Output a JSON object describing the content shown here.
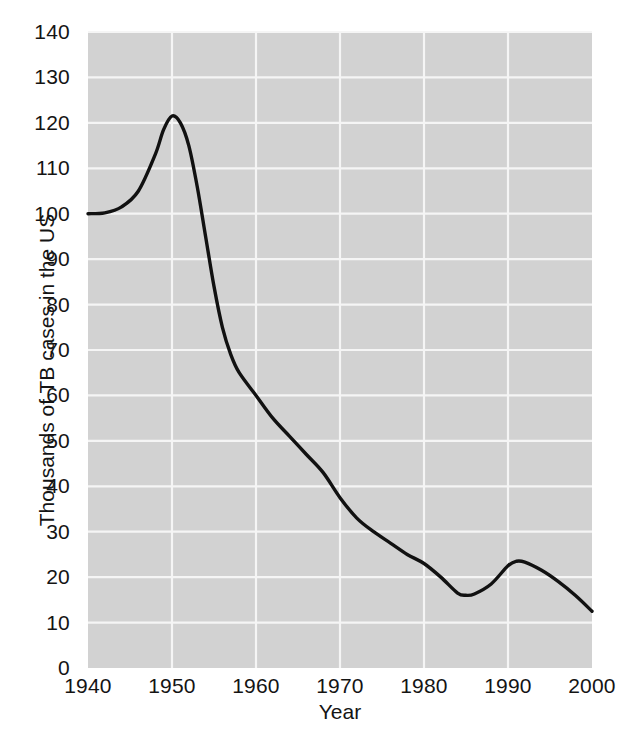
{
  "chart_data": {
    "type": "line",
    "title": "",
    "xlabel": "Year",
    "ylabel": "Thousands of TB cases in the US",
    "xlim": [
      1940,
      2000
    ],
    "ylim": [
      0,
      140
    ],
    "xticks": [
      1940,
      1950,
      1960,
      1970,
      1980,
      1990,
      2000
    ],
    "xtick_labels": [
      "1940",
      "1950",
      "1960",
      "1970",
      "1980",
      "1990",
      "2000"
    ],
    "yticks": [
      0,
      10,
      20,
      30,
      40,
      50,
      60,
      70,
      80,
      90,
      100,
      110,
      120,
      130,
      140
    ],
    "ytick_labels": [
      "0",
      "10",
      "20",
      "30",
      "40",
      "50",
      "60",
      "70",
      "80",
      "90",
      "100",
      "110",
      "120",
      "130",
      "140"
    ],
    "grid": true,
    "legend": null,
    "series": [
      {
        "name": "TB cases in the US",
        "color": "#111111",
        "x": [
          1940,
          1942,
          1944,
          1946,
          1948,
          1949,
          1950,
          1951,
          1952,
          1953,
          1954,
          1955,
          1956,
          1957,
          1958,
          1960,
          1962,
          1964,
          1966,
          1968,
          1970,
          1972,
          1974,
          1976,
          1978,
          1980,
          1982,
          1984,
          1985,
          1986,
          1988,
          1990,
          1991,
          1992,
          1994,
          1996,
          1998,
          2000
        ],
        "values": [
          100,
          100.2,
          101.5,
          105,
          113,
          118.5,
          121.5,
          120,
          115,
          106,
          95,
          84,
          75,
          69,
          65,
          60,
          55,
          51,
          47,
          43,
          37.5,
          33,
          30,
          27.5,
          25,
          23,
          20,
          16.5,
          16,
          16.3,
          18.5,
          22.5,
          23.5,
          23.3,
          21.5,
          19,
          16,
          12.5
        ]
      }
    ],
    "annotations": []
  },
  "figure": {
    "background_color": "#ffffff",
    "plot_background_color": "#d2d2d2",
    "grid_color": "#f5f5f5",
    "line_color": "#111111",
    "text_color": "#141414"
  }
}
